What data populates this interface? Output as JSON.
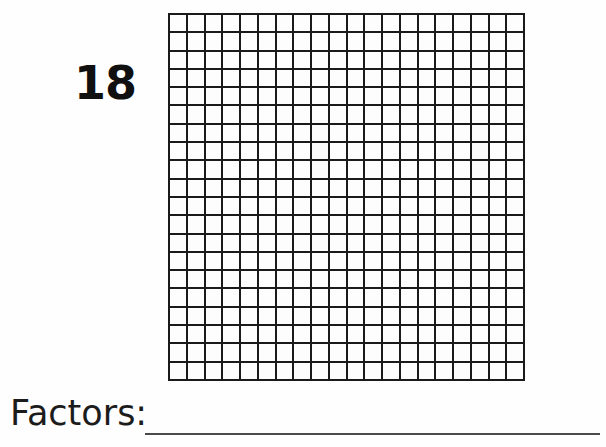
{
  "worksheet": {
    "number_label": "18",
    "factors_prompt": "Factors:",
    "answer_value": ""
  },
  "grid": {
    "rows": 20,
    "columns": 20,
    "total_cells": 400,
    "cell_fill": "#fdfdfd",
    "line_color": "#1a1a1a",
    "shaded_cells": []
  },
  "colors": {
    "page_background": "#fefefe",
    "ink": "#101010",
    "rule_line": "#4a4a4a"
  }
}
